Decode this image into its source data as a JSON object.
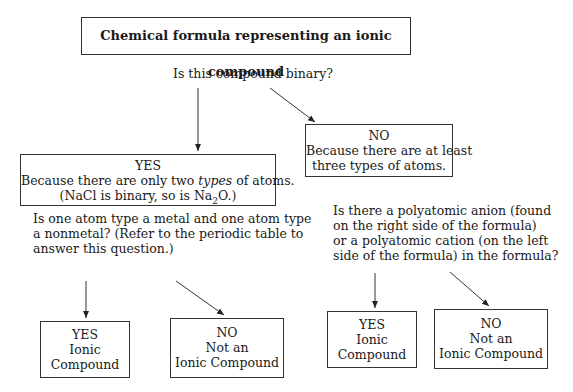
{
  "title": "Chemical formula representing an ionic compound",
  "question_binary": "Is this compound binary?",
  "yes_binary": {
    "label": "YES",
    "reason_prefix": "Because there are only two ",
    "reason_em": "types",
    "reason_suffix": " of atoms.",
    "example_prefix": "(NaCl is binary, so is Na",
    "example_sub": "2",
    "example_suffix": "O.)"
  },
  "no_binary": {
    "label": "NO",
    "reason_line1": "Because there are at least",
    "reason_line2": "three types of atoms."
  },
  "question_metal": {
    "line1": "Is one atom type a metal and one atom type",
    "line2": "a nonmetal? (Refer to the periodic table to",
    "line3": "answer this question.)"
  },
  "question_polyatomic": {
    "line1": "Is there a polyatomic anion (found",
    "line2": "on the right side of the formula)",
    "line3": "or a polyatomic cation (on the left",
    "line4": "side of the formula) in the formula?"
  },
  "outcome_metal_yes": {
    "label": "YES",
    "line1": "Ionic",
    "line2": "Compound"
  },
  "outcome_metal_no": {
    "label": "NO",
    "line1": "Not an",
    "line2": "Ionic Compound"
  },
  "outcome_poly_yes": {
    "label": "YES",
    "line1": "Ionic",
    "line2": "Compound"
  },
  "outcome_poly_no": {
    "label": "NO",
    "line1": "Not an",
    "line2": "Ionic Compound"
  }
}
